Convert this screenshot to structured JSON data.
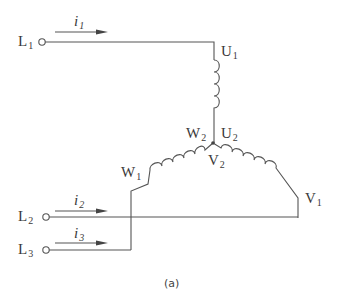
{
  "diagram": {
    "type": "three-phase-winding-star-connection",
    "caption": "(a)",
    "lines": [
      {
        "id": "L1",
        "label": "L",
        "sub": "1",
        "current": "i",
        "current_sub": "1"
      },
      {
        "id": "L2",
        "label": "L",
        "sub": "2",
        "current": "i",
        "current_sub": "2"
      },
      {
        "id": "L3",
        "label": "L",
        "sub": "3",
        "current": "i",
        "current_sub": "3"
      }
    ],
    "terminals": {
      "U1": {
        "label": "U",
        "sub": "1"
      },
      "U2": {
        "label": "U",
        "sub": "2"
      },
      "V1": {
        "label": "V",
        "sub": "1"
      },
      "V2": {
        "label": "V",
        "sub": "2"
      },
      "W1": {
        "label": "W",
        "sub": "1"
      },
      "W2": {
        "label": "W",
        "sub": "2"
      }
    },
    "colors": {
      "stroke": "#555555",
      "text": "#3a3a3a"
    }
  }
}
